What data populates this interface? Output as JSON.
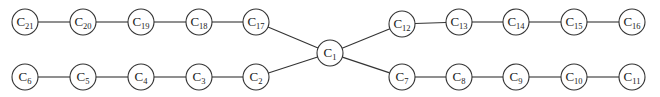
{
  "diagram": {
    "type": "tree-graph",
    "node_radius": 13,
    "colors": {
      "stroke": "#333333",
      "fill": "#ffffff",
      "text": "#222222"
    },
    "nodes": [
      {
        "id": "C1",
        "base": "C",
        "sub": "1",
        "x": 330,
        "y": 53
      },
      {
        "id": "C2",
        "base": "C",
        "sub": "2",
        "x": 256,
        "y": 77
      },
      {
        "id": "C3",
        "base": "C",
        "sub": "3",
        "x": 199,
        "y": 77
      },
      {
        "id": "C4",
        "base": "C",
        "sub": "4",
        "x": 141,
        "y": 77
      },
      {
        "id": "C5",
        "base": "C",
        "sub": "5",
        "x": 83,
        "y": 77
      },
      {
        "id": "C6",
        "base": "C",
        "sub": "6",
        "x": 25,
        "y": 77
      },
      {
        "id": "C7",
        "base": "C",
        "sub": "7",
        "x": 402,
        "y": 77
      },
      {
        "id": "C8",
        "base": "C",
        "sub": "8",
        "x": 459,
        "y": 77
      },
      {
        "id": "C9",
        "base": "C",
        "sub": "9",
        "x": 516,
        "y": 77
      },
      {
        "id": "C10",
        "base": "C",
        "sub": "10",
        "x": 574,
        "y": 77
      },
      {
        "id": "C11",
        "base": "C",
        "sub": "11",
        "x": 632,
        "y": 77
      },
      {
        "id": "C12",
        "base": "C",
        "sub": "12",
        "x": 402,
        "y": 24
      },
      {
        "id": "C13",
        "base": "C",
        "sub": "13",
        "x": 459,
        "y": 22
      },
      {
        "id": "C14",
        "base": "C",
        "sub": "14",
        "x": 516,
        "y": 22
      },
      {
        "id": "C15",
        "base": "C",
        "sub": "15",
        "x": 574,
        "y": 22
      },
      {
        "id": "C16",
        "base": "C",
        "sub": "16",
        "x": 632,
        "y": 22
      },
      {
        "id": "C17",
        "base": "C",
        "sub": "17",
        "x": 256,
        "y": 22
      },
      {
        "id": "C18",
        "base": "C",
        "sub": "18",
        "x": 199,
        "y": 22
      },
      {
        "id": "C19",
        "base": "C",
        "sub": "19",
        "x": 141,
        "y": 22
      },
      {
        "id": "C20",
        "base": "C",
        "sub": "20",
        "x": 83,
        "y": 22
      },
      {
        "id": "C21",
        "base": "C",
        "sub": "21",
        "x": 25,
        "y": 22
      }
    ],
    "edges": [
      [
        "C1",
        "C17"
      ],
      [
        "C1",
        "C2"
      ],
      [
        "C1",
        "C12"
      ],
      [
        "C1",
        "C7"
      ],
      [
        "C17",
        "C18"
      ],
      [
        "C18",
        "C19"
      ],
      [
        "C19",
        "C20"
      ],
      [
        "C20",
        "C21"
      ],
      [
        "C2",
        "C3"
      ],
      [
        "C3",
        "C4"
      ],
      [
        "C4",
        "C5"
      ],
      [
        "C5",
        "C6"
      ],
      [
        "C12",
        "C13"
      ],
      [
        "C13",
        "C14"
      ],
      [
        "C14",
        "C15"
      ],
      [
        "C15",
        "C16"
      ],
      [
        "C7",
        "C8"
      ],
      [
        "C8",
        "C9"
      ],
      [
        "C9",
        "C10"
      ],
      [
        "C10",
        "C11"
      ]
    ]
  }
}
